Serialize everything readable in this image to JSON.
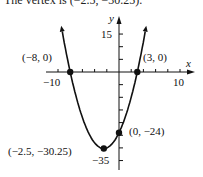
{
  "caption": "The vertex is (−2.5, −30.25).",
  "chart_data": {
    "type": "line",
    "title": "",
    "function": "y = x^2 + 5x - 24",
    "xlabel": "x",
    "ylabel": "y",
    "xlim": [
      -11,
      11
    ],
    "ylim": [
      -38,
      18
    ],
    "x_tick_labels": [
      "−10",
      "10"
    ],
    "y_tick_labels": [
      "15",
      "−35"
    ],
    "x_tick_step": 2,
    "y_tick_step": 5,
    "grid": false,
    "legend": null,
    "series": [
      {
        "name": "parabola",
        "x": [
          -9.5,
          -8,
          -6,
          -4,
          -2.5,
          -1,
          0,
          2,
          3,
          4.5
        ],
        "y": [
          19.75,
          0,
          -18,
          -28,
          -30.25,
          -28,
          -24,
          -10,
          0,
          18.75
        ]
      }
    ],
    "annotations": [
      {
        "label": "(−8, 0)",
        "x": -8,
        "y": 0
      },
      {
        "label": "(3, 0)",
        "x": 3,
        "y": 0
      },
      {
        "label": "(0, −24)",
        "x": 0,
        "y": -24
      },
      {
        "label": "(−2.5, −30.25)",
        "x": -2.5,
        "y": -30.25
      }
    ]
  }
}
